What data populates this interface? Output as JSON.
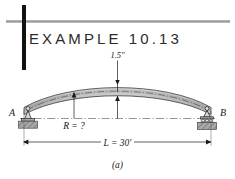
{
  "header": {
    "rule_color": "#9a9a9a",
    "bar_color": "#121212"
  },
  "title": {
    "text": "EXAMPLE 10.13"
  },
  "figure": {
    "caption": "(a)",
    "beam_fill": "#c8c8c8",
    "beam_stroke": "#3a3a3a",
    "support_left_label": "A",
    "support_right_label": "B",
    "camber_label": "1.5″",
    "radius_label": "R = ?",
    "span_label": "L = 30′"
  }
}
